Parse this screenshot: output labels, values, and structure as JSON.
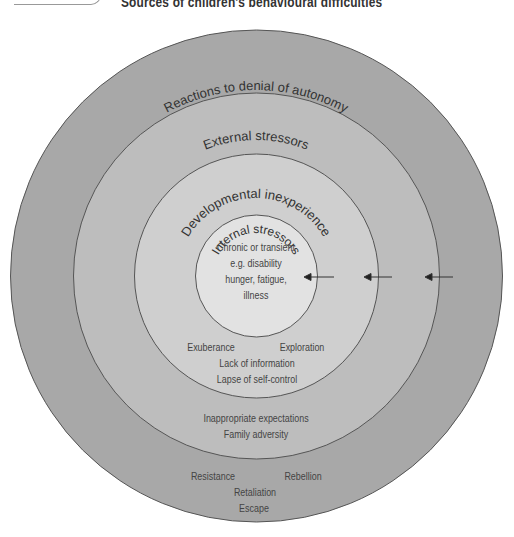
{
  "title": "Sources of children's behavioural difficulties",
  "colors": {
    "outer_ring": "#a8a8a8",
    "ring2": "#bdbdbd",
    "ring3": "#cfcfcf",
    "inner": "#e2e2e2",
    "stroke": "#555555",
    "text": "#444444"
  },
  "rings": [
    {
      "label": "Reactions to denial of autonomy",
      "items": [
        "Resistance",
        "Rebellion",
        "Retaliation",
        "Escape"
      ]
    },
    {
      "label": "External stressors",
      "items": [
        "Inappropriate expectations",
        "Family adversity"
      ]
    },
    {
      "label": "Developmental inexperience",
      "items": [
        "Exuberance",
        "Exploration",
        "Lack of information",
        "Lapse of self-control"
      ]
    },
    {
      "label": "Internal stressors",
      "items": [
        "Chronic or transient",
        "e.g. disability",
        "hunger, fatigue,",
        "illness"
      ]
    }
  ],
  "arrows": [
    {
      "icon": "arrow-left-icon"
    },
    {
      "icon": "arrow-left-icon"
    },
    {
      "icon": "arrow-left-icon"
    }
  ]
}
